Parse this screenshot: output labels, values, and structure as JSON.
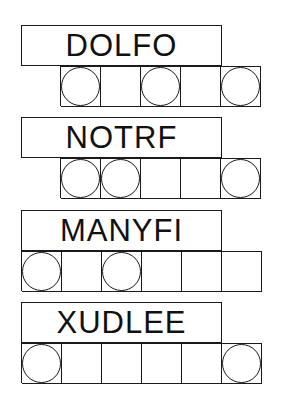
{
  "puzzle": {
    "jumbles": [
      {
        "scrambled": "DOLFO",
        "letter_count": 5,
        "circled": [
          true,
          false,
          true,
          false,
          true
        ]
      },
      {
        "scrambled": "NOTRF",
        "letter_count": 5,
        "circled": [
          true,
          true,
          false,
          false,
          true
        ]
      },
      {
        "scrambled": "MANYFI",
        "letter_count": 6,
        "circled": [
          true,
          false,
          true,
          false,
          false,
          false
        ]
      },
      {
        "scrambled": "XUDLEE",
        "letter_count": 6,
        "circled": [
          true,
          false,
          false,
          false,
          false,
          true
        ]
      }
    ]
  }
}
